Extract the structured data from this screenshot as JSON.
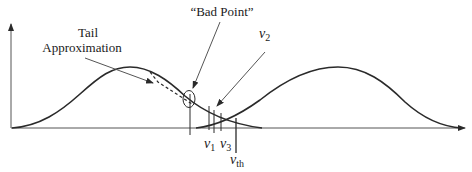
{
  "diagram": {
    "type": "overlapping-distributions",
    "labels": {
      "tail_approximation_line1": "Tail",
      "tail_approximation_line2": "Approximation",
      "bad_point": "“Bad Point”",
      "v2_base": "v",
      "v2_sub": "2",
      "v1_base": "v",
      "v1_sub": "1",
      "v3_base": "v",
      "v3_sub": "3",
      "vth_base": "v",
      "vth_sub": "th"
    },
    "colors": {
      "stroke": "#2a2a2a",
      "background": "#ffffff"
    }
  }
}
